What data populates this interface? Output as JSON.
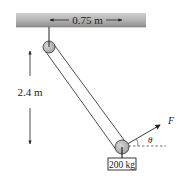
{
  "diagram": {
    "ceiling": {
      "dimension_label": "0.75 m"
    },
    "height_dimension": {
      "label": "2.4 m"
    },
    "force": {
      "label": "F",
      "angle_label": "θ"
    },
    "mass": {
      "label": "200 kg"
    },
    "colors": {
      "ceiling_dark": "#8a8a8a",
      "ceiling_light": "#c8c8c8",
      "pulley_fill": "#b5b5b5",
      "line": "#222222"
    }
  }
}
